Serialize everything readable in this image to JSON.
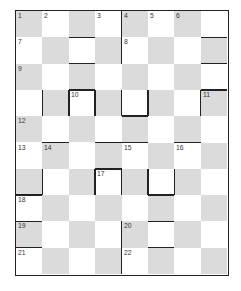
{
  "puzzle": {
    "type": "checkerboard-crossword",
    "rows": 10,
    "cols": 8,
    "colors": {
      "shaded": "#dbdbdb",
      "unshaded": "#ffffff",
      "line": "#222222"
    },
    "numbers": [
      {
        "row": 0,
        "col": 0,
        "label": "1"
      },
      {
        "row": 0,
        "col": 1,
        "label": "2"
      },
      {
        "row": 0,
        "col": 3,
        "label": "3"
      },
      {
        "row": 0,
        "col": 4,
        "label": "4"
      },
      {
        "row": 0,
        "col": 5,
        "label": "5"
      },
      {
        "row": 0,
        "col": 6,
        "label": "6"
      },
      {
        "row": 1,
        "col": 0,
        "label": "7"
      },
      {
        "row": 1,
        "col": 4,
        "label": "8"
      },
      {
        "row": 2,
        "col": 0,
        "label": "9"
      },
      {
        "row": 3,
        "col": 2,
        "label": "10"
      },
      {
        "row": 3,
        "col": 7,
        "label": "11"
      },
      {
        "row": 4,
        "col": 0,
        "label": "12"
      },
      {
        "row": 5,
        "col": 0,
        "label": "13"
      },
      {
        "row": 5,
        "col": 1,
        "label": "14"
      },
      {
        "row": 5,
        "col": 4,
        "label": "15"
      },
      {
        "row": 5,
        "col": 6,
        "label": "16"
      },
      {
        "row": 6,
        "col": 3,
        "label": "17"
      },
      {
        "row": 7,
        "col": 0,
        "label": "18"
      },
      {
        "row": 8,
        "col": 0,
        "label": "19"
      },
      {
        "row": 8,
        "col": 4,
        "label": "20"
      },
      {
        "row": 9,
        "col": 0,
        "label": "21"
      },
      {
        "row": 9,
        "col": 4,
        "label": "22"
      }
    ],
    "bars": {
      "vertical": [
        {
          "row": 0,
          "col": 4
        },
        {
          "row": 1,
          "col": 4
        },
        {
          "row": 3,
          "col": 1
        },
        {
          "row": 3,
          "col": 2
        },
        {
          "row": 3,
          "col": 3
        },
        {
          "row": 3,
          "col": 4
        },
        {
          "row": 3,
          "col": 5
        },
        {
          "row": 3,
          "col": 7
        },
        {
          "row": 6,
          "col": 1
        },
        {
          "row": 6,
          "col": 3
        },
        {
          "row": 6,
          "col": 4
        },
        {
          "row": 6,
          "col": 5
        },
        {
          "row": 6,
          "col": 6
        },
        {
          "row": 8,
          "col": 4
        },
        {
          "row": 9,
          "col": 4
        }
      ],
      "horizontal": [
        {
          "row": 1,
          "col": 2
        },
        {
          "row": 2,
          "col": 2
        },
        {
          "row": 1,
          "col": 7
        },
        {
          "row": 2,
          "col": 7
        },
        {
          "row": 3,
          "col": 2
        },
        {
          "row": 3,
          "col": 7
        },
        {
          "row": 4,
          "col": 4
        },
        {
          "row": 5,
          "col": 1
        },
        {
          "row": 5,
          "col": 3
        },
        {
          "row": 5,
          "col": 4
        },
        {
          "row": 5,
          "col": 6
        },
        {
          "row": 6,
          "col": 3
        },
        {
          "row": 7,
          "col": 0
        },
        {
          "row": 7,
          "col": 5
        },
        {
          "row": 8,
          "col": 0
        },
        {
          "row": 8,
          "col": 5
        },
        {
          "row": 9,
          "col": 0
        },
        {
          "row": 9,
          "col": 5
        }
      ]
    }
  }
}
